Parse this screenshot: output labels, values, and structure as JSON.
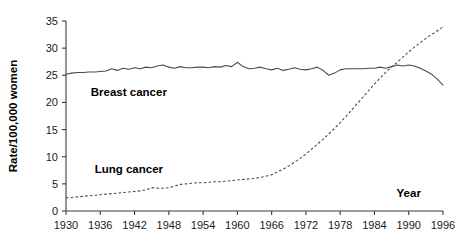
{
  "chart_data": {
    "type": "line",
    "title": "",
    "xlabel": "Year",
    "ylabel": "Rate/100,000 women",
    "xlim": [
      1930,
      1996
    ],
    "ylim": [
      0,
      35
    ],
    "grid": false,
    "legend_position": "inline-annotations",
    "xticks": [
      1930,
      1936,
      1942,
      1948,
      1954,
      1960,
      1966,
      1972,
      1978,
      1984,
      1990,
      1996
    ],
    "yticks": [
      0,
      5,
      10,
      15,
      20,
      25,
      30,
      35
    ],
    "xtick_labels": [
      "1930",
      "1936",
      "1942",
      "1948",
      "1954",
      "1960",
      "1966",
      "1972",
      "1978",
      "1984",
      "1990",
      "1996"
    ],
    "ytick_labels": [
      "0",
      "5",
      "10",
      "15",
      "20",
      "25",
      "30",
      "35"
    ],
    "annotations": [
      {
        "text": "Breast cancer",
        "x": 1941,
        "y": 21.2
      },
      {
        "text": "Lung cancer",
        "x": 1941,
        "y": 7.0
      },
      {
        "text": "Year",
        "x": 1990,
        "y": 2.6
      }
    ],
    "x": [
      1930,
      1931,
      1932,
      1933,
      1934,
      1935,
      1936,
      1937,
      1938,
      1939,
      1940,
      1941,
      1942,
      1943,
      1944,
      1945,
      1946,
      1947,
      1948,
      1949,
      1950,
      1951,
      1952,
      1953,
      1954,
      1955,
      1956,
      1957,
      1958,
      1959,
      1960,
      1961,
      1962,
      1963,
      1964,
      1965,
      1966,
      1967,
      1968,
      1969,
      1970,
      1971,
      1972,
      1973,
      1974,
      1975,
      1976,
      1977,
      1978,
      1979,
      1980,
      1981,
      1982,
      1983,
      1984,
      1985,
      1986,
      1987,
      1988,
      1989,
      1990,
      1991,
      1992,
      1993,
      1994,
      1995,
      1996
    ],
    "series": [
      {
        "name": "Breast cancer",
        "style": "solid",
        "values": [
          25.2,
          25.4,
          25.5,
          25.5,
          25.6,
          25.6,
          25.7,
          25.8,
          26.2,
          25.9,
          26.3,
          26.1,
          26.4,
          26.2,
          26.5,
          26.4,
          26.7,
          26.9,
          26.5,
          26.3,
          26.6,
          26.4,
          26.4,
          26.5,
          26.5,
          26.4,
          26.6,
          26.5,
          26.8,
          26.6,
          27.4,
          26.6,
          26.2,
          26.3,
          26.5,
          26.2,
          26.0,
          26.3,
          25.9,
          26.1,
          26.4,
          26.1,
          26.0,
          26.2,
          26.5,
          25.9,
          25.0,
          25.4,
          26.0,
          26.2,
          26.2,
          26.2,
          26.2,
          26.3,
          26.3,
          26.5,
          26.3,
          26.6,
          26.9,
          26.7,
          26.9,
          26.7,
          26.3,
          25.8,
          25.2,
          24.3,
          23.2
        ]
      },
      {
        "name": "Lung cancer",
        "style": "dashed",
        "values": [
          2.4,
          2.5,
          2.6,
          2.7,
          2.8,
          2.9,
          3.0,
          3.1,
          3.2,
          3.3,
          3.4,
          3.5,
          3.6,
          3.7,
          3.9,
          4.3,
          4.2,
          4.2,
          4.3,
          4.6,
          4.9,
          5.0,
          5.1,
          5.2,
          5.2,
          5.3,
          5.4,
          5.4,
          5.5,
          5.6,
          5.7,
          5.8,
          5.9,
          6.0,
          6.2,
          6.4,
          6.7,
          7.2,
          7.7,
          8.3,
          9.0,
          9.7,
          10.5,
          11.4,
          12.3,
          13.2,
          14.2,
          15.2,
          16.3,
          17.4,
          18.6,
          19.8,
          21.0,
          22.2,
          23.4,
          24.5,
          25.6,
          26.5,
          27.4,
          28.4,
          29.3,
          30.2,
          31.0,
          31.8,
          32.5,
          33.2,
          33.9
        ]
      }
    ]
  },
  "plot_geometry": {
    "left": 66,
    "right": 443,
    "top": 21,
    "bottom": 211
  },
  "colors": {
    "axis": "#3c3c3c",
    "series": "#4a4a4a",
    "background": "#ffffff",
    "text": "#000000"
  }
}
